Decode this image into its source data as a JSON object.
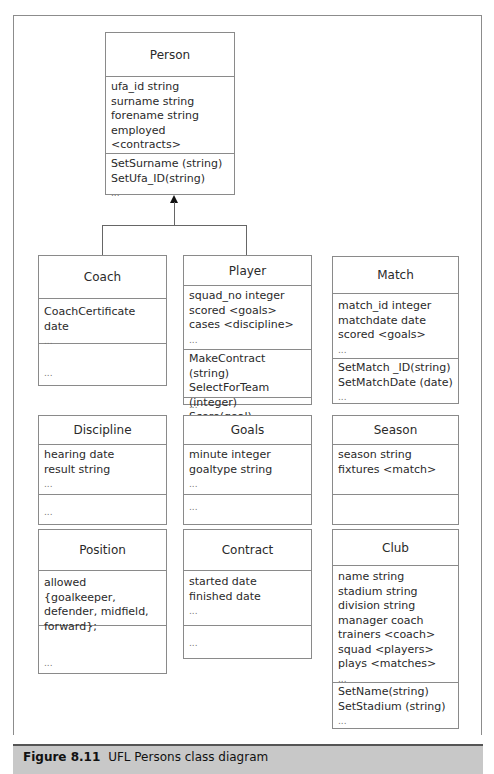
{
  "caption": {
    "figure_label": "Figure 8.11",
    "text": "UFL Persons class diagram"
  },
  "classes": {
    "person": {
      "name": "Person",
      "attributes": [
        "ufa_id string",
        "surname string",
        "forename string",
        "employed <contracts>",
        "..."
      ],
      "operations": [
        "SetSurname (string)",
        "SetUfa_ID(string)",
        "..."
      ]
    },
    "coach": {
      "name": "Coach",
      "attributes": [
        "CoachCertificate  date",
        "..."
      ],
      "operations": [
        "",
        "..."
      ]
    },
    "player": {
      "name": "Player",
      "attributes": [
        "squad_no integer",
        "scored <goals>",
        "cases <discipline>",
        "..."
      ],
      "operations": [
        "MakeContract  (string)",
        "SelectForTeam (integer)",
        "Score(goal)"
      ],
      "extra": [
        "..."
      ]
    },
    "match": {
      "name": "Match",
      "attributes": [
        "match_id integer",
        "matchdate date",
        "scored <goals>",
        "..."
      ],
      "operations": [
        "SetMatch _ID(string)",
        "SetMatchDate (date)",
        "..."
      ]
    },
    "discipline": {
      "name": "Discipline",
      "attributes": [
        "hearing date",
        "result string",
        "..."
      ],
      "operations": [
        "..."
      ]
    },
    "goals": {
      "name": "Goals",
      "attributes": [
        "minute integer",
        "goaltype string",
        "..."
      ],
      "operations": [
        "..."
      ]
    },
    "season": {
      "name": "Season",
      "attributes": [
        "season string",
        "fixtures <match>"
      ],
      "operations": []
    },
    "position": {
      "name": "Position",
      "attributes": [
        "allowed {goalkeeper,",
        "defender,  midfield,",
        "forward};"
      ],
      "operations": [
        "",
        "",
        "..."
      ]
    },
    "contract": {
      "name": "Contract",
      "attributes": [
        "started date",
        "finished date",
        "..."
      ],
      "operations": [
        "..."
      ]
    },
    "club": {
      "name": "Club",
      "attributes": [
        "name string",
        "stadium string",
        "division string",
        "manager coach",
        "trainers <coach>",
        "squad <players>",
        "plays <matches>",
        "..."
      ],
      "operations": [
        "SetName(string)",
        "SetStadium (string)",
        "..."
      ]
    }
  },
  "relationships": [
    {
      "type": "generalization",
      "from": "Coach",
      "to": "Person"
    },
    {
      "type": "generalization",
      "from": "Player",
      "to": "Person"
    }
  ]
}
